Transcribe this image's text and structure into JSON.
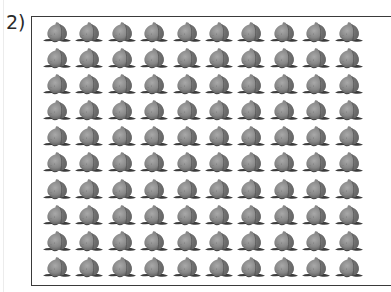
{
  "problem": {
    "label": "2)"
  },
  "grid": {
    "rows": 10,
    "columns": 10,
    "item_icon": "peach-icon",
    "item_count": 100
  },
  "colors": {
    "frame_border": "#3a3a3a",
    "peach_body": "#8a8a8a",
    "peach_shadow": "#5e5e5e",
    "peach_highlight": "#b8b8b8",
    "leaf": "#3c3c3c"
  }
}
